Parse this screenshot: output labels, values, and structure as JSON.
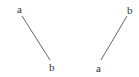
{
  "diagram": {
    "segments": [
      {
        "id": "left",
        "start": {
          "label": "a",
          "x": 22,
          "y": 16,
          "label_x": 17,
          "label_y": 13
        },
        "end": {
          "label": "b",
          "x": 50,
          "y": 60,
          "label_x": 49,
          "label_y": 71
        }
      },
      {
        "id": "right",
        "start": {
          "label": "a",
          "x": 101,
          "y": 60,
          "label_x": 96,
          "label_y": 72
        },
        "end": {
          "label": "b",
          "x": 127,
          "y": 16,
          "label_x": 127,
          "label_y": 14
        }
      }
    ],
    "line_color": "#666666"
  }
}
